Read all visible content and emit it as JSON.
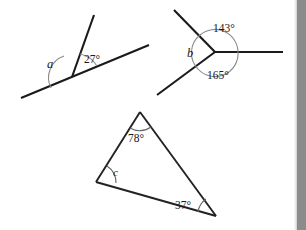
{
  "page": {
    "background_color": "#ffffff",
    "ink_color": "#1a1a1a",
    "arc_color": "#8a8a8a"
  },
  "figures": [
    {
      "id": "figure-straight-line-angles",
      "name": "Angles on a straight line",
      "known_angle": "27°",
      "unknown_angle": "a",
      "description": "A ray rises from a point on a straight line; the angle between the ray and the right part of the line is 27 degrees, and the angle between the ray and the left part of the line is a."
    },
    {
      "id": "figure-angles-at-a-point",
      "name": "Angles around a point",
      "known_angle_upper": "143°",
      "known_angle_lower": "165°",
      "unknown_angle": "b",
      "description": "Three rays meet at a point. Going clockwise the angles are 143 degrees, 165 degrees and b."
    },
    {
      "id": "figure-triangle-angles",
      "name": "Triangle interior angles",
      "known_angle_apex": "78°",
      "known_angle_right": "37°",
      "unknown_angle": "c",
      "description": "A triangle with apex angle 78 degrees, bottom-right angle 37 degrees and bottom-left angle c."
    }
  ],
  "scrollbar": {
    "name": "vertical-scrollbar",
    "track_color": "#8f8f8f",
    "thumb_color": "#8c8c8c",
    "position": "right"
  }
}
